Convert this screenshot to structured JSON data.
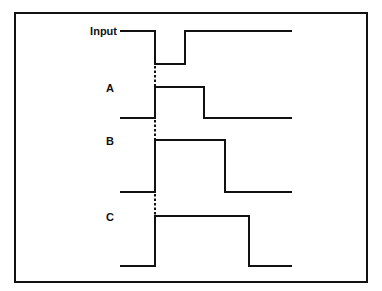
{
  "diagram": {
    "title": "",
    "frame": {
      "x": 15,
      "y": 13,
      "width": 352,
      "height": 269,
      "stroke": "#111111"
    },
    "line_color": "#111111",
    "reference_line": {
      "x": 155,
      "style": "dashed",
      "segments": [
        [
          66,
          86
        ],
        [
          120,
          139
        ],
        [
          194,
          215
        ]
      ]
    },
    "signals": [
      {
        "name": "Input",
        "label_x": 117,
        "label_y": 35,
        "label_anchor": "end",
        "points": [
          [
            120,
            31
          ],
          [
            155,
            31
          ],
          [
            155,
            64
          ],
          [
            185,
            64
          ],
          [
            185,
            31
          ],
          [
            292,
            31
          ]
        ]
      },
      {
        "name": "A",
        "label_x": 110,
        "label_y": 92,
        "label_anchor": "middle",
        "points": [
          [
            120,
            118
          ],
          [
            155,
            118
          ],
          [
            155,
            87
          ],
          [
            204,
            87
          ],
          [
            204,
            118
          ],
          [
            292,
            118
          ]
        ]
      },
      {
        "name": "B",
        "label_x": 110,
        "label_y": 145,
        "label_anchor": "middle",
        "points": [
          [
            120,
            192
          ],
          [
            155,
            192
          ],
          [
            155,
            140
          ],
          [
            225,
            140
          ],
          [
            225,
            192
          ],
          [
            292,
            192
          ]
        ]
      },
      {
        "name": "C",
        "label_x": 110,
        "label_y": 221,
        "label_anchor": "middle",
        "points": [
          [
            120,
            266
          ],
          [
            155,
            266
          ],
          [
            155,
            216
          ],
          [
            249,
            216
          ],
          [
            249,
            266
          ],
          [
            292,
            266
          ]
        ]
      }
    ]
  }
}
